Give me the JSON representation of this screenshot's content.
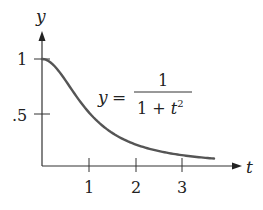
{
  "chart_data": {
    "type": "line",
    "title": "",
    "xlabel": "t",
    "ylabel": "y",
    "equation": {
      "lhs": "y",
      "equals": "=",
      "numerator": "1",
      "denominator_prefix": "1 + ",
      "denominator_var": "t",
      "denominator_exp": "2"
    },
    "x_ticks": [
      "1",
      "2",
      "3"
    ],
    "y_ticks": [
      "1",
      ".5"
    ],
    "xlim": [
      0,
      3.9
    ],
    "ylim": [
      0,
      1.25
    ],
    "grid": false,
    "legend": "none",
    "series": [
      {
        "name": "y = 1/(1+t^2)",
        "x": [
          0,
          0.25,
          0.5,
          0.75,
          1,
          1.25,
          1.5,
          1.75,
          2,
          2.25,
          2.5,
          2.75,
          3,
          3.25,
          3.5,
          3.66
        ],
        "values": [
          1.0,
          0.941,
          0.8,
          0.64,
          0.5,
          0.39,
          0.308,
          0.246,
          0.2,
          0.165,
          0.138,
          0.117,
          0.1,
          0.086,
          0.075,
          0.069
        ],
        "color": "#555555"
      }
    ]
  }
}
